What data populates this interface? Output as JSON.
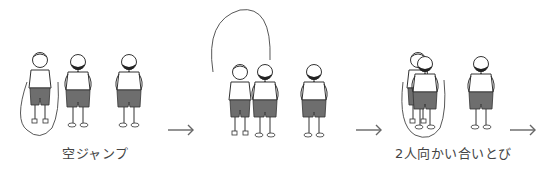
{
  "diagram": {
    "type": "instructional-illustration",
    "colors": {
      "line": "#333333",
      "shorts": "#6e6e6e",
      "arrow": "#666666",
      "caption": "#444444",
      "background": "#ffffff"
    },
    "steps": [
      {
        "id": "step-1",
        "caption": "空ジャンプ",
        "description": "One child jumps with rope alone while two others practice jumping without rope"
      },
      {
        "id": "step-2",
        "caption": "",
        "description": "Rope swung overhead, one child steps in next to the jumper"
      },
      {
        "id": "step-3",
        "caption": "2人向かい合いとび",
        "description": "Two children face each other and jump inside the same rope"
      }
    ],
    "arrows": [
      {
        "id": "arrow-1",
        "glyph": "→"
      },
      {
        "id": "arrow-2",
        "glyph": "→"
      },
      {
        "id": "arrow-3",
        "glyph": "→"
      }
    ]
  }
}
